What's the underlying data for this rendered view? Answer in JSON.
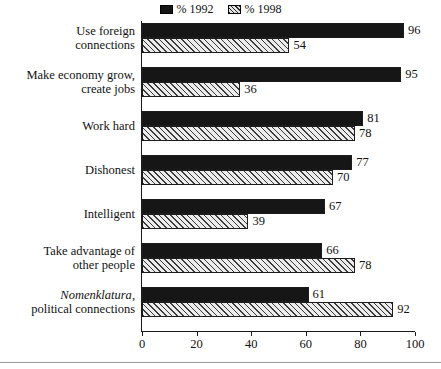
{
  "legend": {
    "position": "top-center",
    "entries": [
      {
        "label": "% 1992",
        "swatch": "solid-black-swatch",
        "color": "#161616"
      },
      {
        "label": "% 1998",
        "swatch": "hatched-swatch",
        "color": "#dedede"
      }
    ]
  },
  "axis": {
    "tick_labels": [
      "0",
      "20",
      "40",
      "60",
      "80",
      "100"
    ]
  },
  "chart_data": {
    "type": "bar",
    "orientation": "horizontal",
    "title": "",
    "subtitle": "",
    "xlabel": "",
    "ylabel": "",
    "xlim": [
      0,
      100
    ],
    "xticks": [
      0,
      20,
      40,
      60,
      80,
      100
    ],
    "grid": false,
    "legend_position": "top-center",
    "categories": [
      "Use foreign connections",
      "Make economy grow, create jobs",
      "Work hard",
      "Dishonest",
      "Intelligent",
      "Take advantage of other people",
      "Nomenklatura, political connections"
    ],
    "category_lines": [
      [
        "Use foreign",
        "connections"
      ],
      [
        "Make economy grow,",
        "create jobs"
      ],
      [
        "Work hard"
      ],
      [
        "Dishonest"
      ],
      [
        "Intelligent"
      ],
      [
        "Take advantage of",
        "other people"
      ],
      [
        "Nomenklatura,",
        "political connections"
      ]
    ],
    "series": [
      {
        "name": "% 1992",
        "values": [
          96,
          95,
          81,
          77,
          67,
          66,
          61
        ]
      },
      {
        "name": "% 1998",
        "values": [
          54,
          36,
          78,
          70,
          39,
          78,
          92
        ]
      }
    ]
  }
}
